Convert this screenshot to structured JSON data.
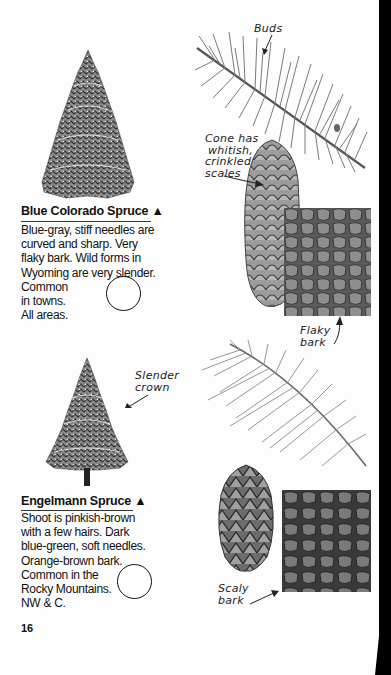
{
  "page": {
    "page_number": "16",
    "species": [
      {
        "name": "Blue Colorado Spruce",
        "marker": "▲",
        "description_lines": [
          "Blue-gray, stiff needles are",
          "curved and sharp. Very",
          "flaky bark. Wild forms in",
          "Wyoming are very slender.",
          "Common",
          "in towns.",
          "All areas."
        ],
        "illustrations": {
          "tree": "spruce-tree-icon",
          "twig": "needle-twig-icon",
          "cone": "cone-icon",
          "bark": "bark-icon"
        },
        "labels": {
          "buds": "Buds",
          "cone": [
            "Cone has",
            "whitish,",
            "crinkled",
            "scales"
          ],
          "bark": [
            "Flaky",
            "bark"
          ]
        }
      },
      {
        "name": "Engelmann Spruce",
        "marker": "▲",
        "description_lines": [
          "Shoot is pinkish-brown",
          "with a few hairs. Dark",
          "blue-green, soft needles.",
          "Orange-brown bark.",
          "Common in the",
          "Rocky Mountains.",
          "NW & C."
        ],
        "illustrations": {
          "tree": "slender-spruce-tree-icon",
          "twig": "needle-twig-icon",
          "cone": "cone-icon",
          "bark": "bark-icon"
        },
        "labels": {
          "crown": [
            "Slender",
            "crown"
          ],
          "bark": [
            "Scaly",
            "bark"
          ]
        }
      }
    ],
    "colors": {
      "ink": "#111111",
      "paper": "#fdfdfd",
      "foliage": "#6e6e6e",
      "bark_dark": "#3a3a3a"
    }
  }
}
